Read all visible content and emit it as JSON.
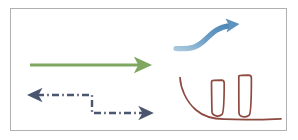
{
  "canvas": {
    "width": 298,
    "height": 140,
    "background": "#ffffff",
    "title": "hand-drawn arrow and sketch diagram"
  },
  "frame": {
    "name": "slide-border",
    "x": 10,
    "y": 8,
    "width": 277,
    "height": 123,
    "stroke": "#b0b0b0",
    "stroke_width": 1,
    "fill": "#ffffff"
  },
  "palette": {
    "orange": "#C8833C",
    "green": "#7FA760",
    "navy": "#4A5570",
    "blue": "#5B92BE",
    "blue_light": "#8FB8D6",
    "brown": "#8C4A40",
    "border_gray": "#b0b0b0",
    "page_white": "#ffffff"
  },
  "shapes": [
    {
      "id": "orange-bar",
      "name": "orange-horizontal-line",
      "kind": "line",
      "color": "#C8833C",
      "stroke_width": 4,
      "dash": "solid",
      "arrowhead": "none",
      "x1": 30,
      "y1": 42,
      "x2": 136,
      "y2": 42
    },
    {
      "id": "green-arrow",
      "name": "green-right-arrow",
      "kind": "line",
      "color": "#7FA760",
      "stroke_width": 3,
      "dash": "solid",
      "arrowhead": "end",
      "x1": 30,
      "y1": 65,
      "x2": 141,
      "y2": 65
    },
    {
      "id": "navy-dashdot-path",
      "name": "navy-dash-dot-double-arrow",
      "kind": "polyline",
      "color": "#4A5570",
      "stroke_width": 2.4,
      "dash": "dash-dot",
      "arrowhead": "both",
      "points": [
        {
          "x": 36,
          "y": 95
        },
        {
          "x": 92,
          "y": 95
        },
        {
          "x": 92,
          "y": 114
        },
        {
          "x": 145,
          "y": 114
        }
      ]
    },
    {
      "id": "blue-swoosh",
      "name": "blue-curved-rising-arrow",
      "kind": "curve",
      "color": "#5B92BE",
      "stroke_width": 5,
      "dash": "solid",
      "arrowhead": "end",
      "path": "M176,48 C192,49 197,47 205,39 C213,31 219,25 233,24",
      "tip": {
        "x": 238,
        "y": 23
      }
    },
    {
      "id": "brown-sketch",
      "name": "brown-freehand-sketch",
      "kind": "freehand",
      "color": "#8C4A40",
      "stroke_width": 1.8,
      "dash": "solid",
      "arrowhead": "none",
      "strokes": [
        "M180,78 C180,88 186,101 196,110 C204,117 213,119 224,119 C240,120 258,120 281,119",
        "M211,82 C211,82 212,110 212,112 C213,116 219,117 222,114 C224,112 224,94 224,83 C224,81 223,80 221,80 L213,80 C212,80 211,81 211,82 Z",
        "M239,76 C239,76 239,109 239,113 C239,117 246,118 249,115 C251,113 251,90 251,78 C251,76 250,75 248,75 L241,75 C240,75 239,75 239,76 Z"
      ]
    }
  ]
}
